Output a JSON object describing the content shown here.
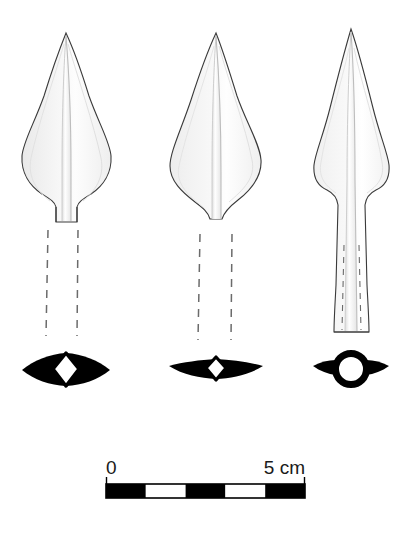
{
  "figure": {
    "kind": "archaeological-artifact-drawing",
    "background_color": "#ffffff",
    "outline_color": "#3a3a3a",
    "fill_light": "#fcfcfc",
    "fill_shade": "#ececec",
    "fill_mid": "#f4f4f4",
    "section_color": "#000000",
    "dash_color": "#6b6b6b"
  },
  "views": [
    {
      "id": "view-a",
      "name": "face-view-left",
      "label": "",
      "center_x": 66,
      "tip_y": 33,
      "blade_widest_y": 150,
      "blade_half_width": 44,
      "blade_base_y": 205,
      "tang_half_width": 9,
      "tang_end_y": 222,
      "has_midrib": true,
      "dashed_socket": {
        "top_y": 228,
        "bottom_y": 335,
        "left_x": 48,
        "right_x": 78
      }
    },
    {
      "id": "view-b",
      "name": "face-view-middle",
      "label": "",
      "center_x": 216,
      "tip_y": 33,
      "blade_widest_y": 150,
      "blade_half_width": 46,
      "blade_base_y": 215,
      "tang_half_width": 6,
      "tang_end_y": 222,
      "has_midrib": true,
      "dashed_socket": {
        "top_y": 232,
        "bottom_y": 338,
        "left_x": 200,
        "right_x": 232
      }
    },
    {
      "id": "view-c",
      "name": "profile-view-right",
      "label": "",
      "center_x": 351,
      "tip_y": 29,
      "blade_widest_y": 150,
      "blade_half_width": 37,
      "blade_base_y": 193,
      "socket_top_half_width": 13,
      "socket_bottom_half_width": 17,
      "socket_end_y": 333,
      "has_midrib": true,
      "dashed_socket": {
        "top_y": 245,
        "bottom_y": 330,
        "left_x": 343,
        "right_x": 359
      }
    }
  ],
  "cross_sections": [
    {
      "id": "section-a",
      "name": "cross-section-lenticular-with-rhombic-void",
      "center_x": 66,
      "center_y": 369,
      "half_width": 44,
      "half_height": 14,
      "void_shape": "rhombus",
      "void_half_width": 12,
      "void_half_height": 16
    },
    {
      "id": "section-b",
      "name": "cross-section-thin-blade-with-rhombic-void",
      "center_x": 216,
      "center_y": 369,
      "half_width": 47,
      "half_height": 7,
      "void_shape": "rhombus",
      "void_half_width": 9,
      "void_half_height": 11
    },
    {
      "id": "section-c",
      "name": "cross-section-socket-circular-with-wings",
      "center_x": 351,
      "center_y": 369,
      "half_width": 38,
      "ring_outer_radius": 19,
      "ring_inner_radius": 12,
      "void_shape": "circle"
    }
  ],
  "scale_bar": {
    "name": "scale-bar",
    "start_label": "0",
    "end_label": "5 cm",
    "unit": "cm",
    "total_value": 5,
    "segments": 5,
    "segment_colors": [
      "#000000",
      "#ffffff",
      "#000000",
      "#ffffff",
      "#000000"
    ],
    "x_start": 106,
    "x_end": 305,
    "bar_top_y": 483,
    "bar_height": 14,
    "label_baseline_y": 473,
    "border_color": "#000000"
  }
}
